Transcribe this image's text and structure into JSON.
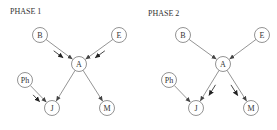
{
  "panels": [
    {
      "id": "phase-1",
      "title": "PHASE 1",
      "nodes": [
        {
          "id": "B",
          "label": "B"
        },
        {
          "id": "E",
          "label": "E"
        },
        {
          "id": "A",
          "label": "A"
        },
        {
          "id": "Ph",
          "label": "Ph"
        },
        {
          "id": "J",
          "label": "J"
        },
        {
          "id": "M",
          "label": "M"
        }
      ],
      "edges": [
        {
          "from": "B",
          "to": "A"
        },
        {
          "from": "E",
          "to": "A"
        },
        {
          "from": "A",
          "to": "J"
        },
        {
          "from": "A",
          "to": "M"
        },
        {
          "from": "Ph",
          "to": "J"
        }
      ],
      "flow_arrows_on_edges": [
        {
          "from": "B",
          "to": "A"
        },
        {
          "from": "E",
          "to": "A"
        },
        {
          "from": "Ph",
          "to": "J"
        }
      ]
    },
    {
      "id": "phase-2",
      "title": "PHASE 2",
      "nodes": [
        {
          "id": "B",
          "label": "B"
        },
        {
          "id": "E",
          "label": "E"
        },
        {
          "id": "A",
          "label": "A"
        },
        {
          "id": "Ph",
          "label": "Ph"
        },
        {
          "id": "J",
          "label": "J"
        },
        {
          "id": "M",
          "label": "M"
        }
      ],
      "edges": [
        {
          "from": "B",
          "to": "A"
        },
        {
          "from": "E",
          "to": "A"
        },
        {
          "from": "A",
          "to": "J"
        },
        {
          "from": "A",
          "to": "M"
        },
        {
          "from": "Ph",
          "to": "J"
        }
      ],
      "flow_arrows_on_edges": [
        {
          "from": "A",
          "to": "J"
        },
        {
          "from": "A",
          "to": "M"
        }
      ]
    }
  ]
}
